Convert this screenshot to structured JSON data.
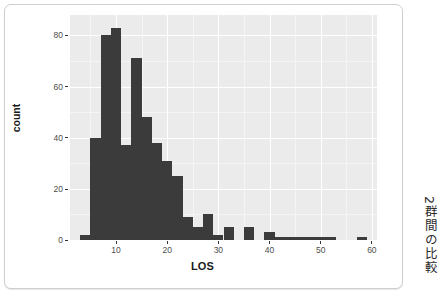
{
  "figure": {
    "side_label": "2群間の比較",
    "footer_text": ""
  },
  "chart_data": {
    "type": "bar",
    "title": "",
    "subtitle": "",
    "xlabel": "LOS",
    "ylabel": "count",
    "grid": true,
    "legend": null,
    "panel_background": "#ebebeb",
    "bar_color": "#3b3b3b",
    "xlim": [
      1,
      61
    ],
    "ylim": [
      0,
      88
    ],
    "xticks": [
      10,
      20,
      30,
      40,
      50,
      60
    ],
    "xtick_labels": [
      "10",
      "20",
      "30",
      "40",
      "50",
      "60"
    ],
    "xticks_minor": [
      5,
      15,
      25,
      35,
      45,
      55
    ],
    "yticks": [
      0,
      20,
      40,
      60,
      80
    ],
    "ytick_labels": [
      "0",
      "20",
      "40",
      "60",
      "80"
    ],
    "yticks_minor": [
      10,
      30,
      50,
      70
    ],
    "bin_width": 2,
    "bin_starts": [
      3,
      5,
      7,
      9,
      11,
      13,
      15,
      17,
      19,
      21,
      23,
      25,
      27,
      29,
      31,
      33,
      35,
      37,
      39,
      41,
      43,
      45,
      47,
      49,
      51,
      53,
      55,
      57
    ],
    "values": [
      2,
      40,
      80,
      83,
      37,
      71,
      48,
      38,
      31,
      25,
      9,
      5,
      10,
      2,
      5,
      0,
      5,
      0,
      3,
      1,
      1,
      1,
      1,
      1,
      1,
      0,
      0,
      1
    ]
  }
}
